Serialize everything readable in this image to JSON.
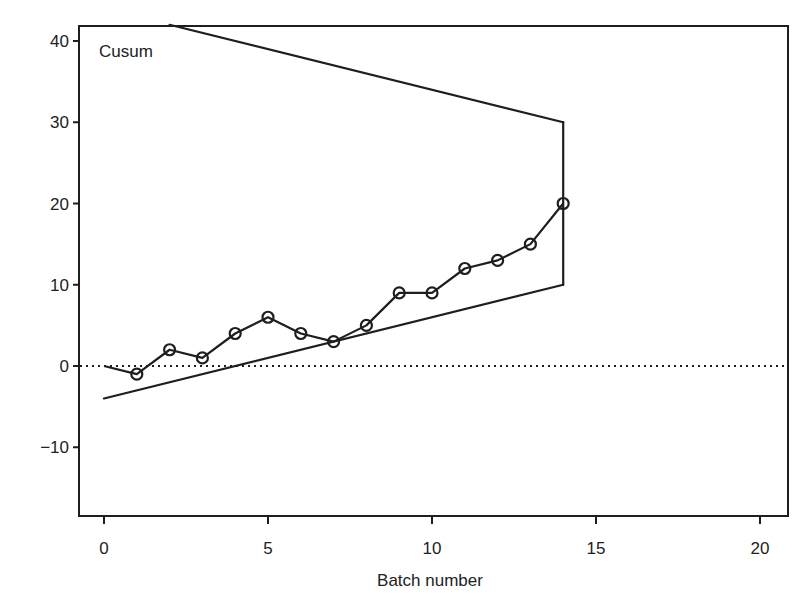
{
  "chart_data": {
    "type": "line",
    "title": "",
    "inplot_label": "Cusum",
    "xlabel": "Batch number",
    "ylabel": "",
    "xlim": [
      -0.8,
      20.8
    ],
    "ylim": [
      -18.5,
      42
    ],
    "x_ticks": [
      0,
      5,
      10,
      15,
      20
    ],
    "y_ticks": [
      -10,
      0,
      10,
      20,
      30,
      40
    ],
    "x_tick_labels": [
      "0",
      "5",
      "10",
      "15",
      "20"
    ],
    "y_tick_labels": [
      "−10",
      "0",
      "10",
      "20",
      "30",
      "40"
    ],
    "grid": false,
    "legend": null,
    "reference_line": {
      "y": 0,
      "style": "dotted"
    },
    "series": [
      {
        "name": "Cusum",
        "x": [
          0,
          1,
          2,
          3,
          4,
          5,
          6,
          7,
          8,
          9,
          10,
          11,
          12,
          13,
          14
        ],
        "values": [
          0,
          -1,
          2,
          1,
          4,
          6,
          4,
          3,
          5,
          9,
          9,
          12,
          13,
          15,
          20
        ],
        "marker": "open-circle",
        "marker_from_index": 1
      }
    ],
    "v_mask": {
      "vertex_batch": 14,
      "upper_arm": [
        [
          2,
          42
        ],
        [
          14,
          30
        ]
      ],
      "lower_arm": [
        [
          0,
          -4
        ],
        [
          14,
          10
        ]
      ],
      "vertical_segment": [
        [
          14,
          10
        ],
        [
          14,
          30
        ]
      ]
    }
  }
}
